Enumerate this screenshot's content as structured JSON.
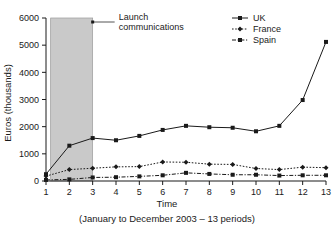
{
  "chart_data": {
    "type": "line",
    "title": "",
    "xlabel": "Time",
    "ylabel": "Euros (thousands)",
    "caption": "(January to December 2003 – 13 periods)",
    "x": [
      1,
      2,
      3,
      4,
      5,
      6,
      7,
      8,
      9,
      10,
      11,
      12,
      13
    ],
    "xtick_labels": [
      "1",
      "2",
      "3",
      "4",
      "5",
      "6",
      "7",
      "8",
      "9",
      "10",
      "11",
      "12",
      "13"
    ],
    "ytick_labels": [
      "0",
      "1000",
      "2000",
      "3000",
      "4000",
      "5000",
      "6000"
    ],
    "yticks": [
      0,
      1000,
      2000,
      3000,
      4000,
      5000,
      6000
    ],
    "xlim": [
      1,
      13
    ],
    "ylim": [
      0,
      6000
    ],
    "grid": false,
    "legend_position": "top-right",
    "series": [
      {
        "name": "UK",
        "values": [
          250,
          1300,
          1580,
          1500,
          1660,
          1880,
          2030,
          1980,
          1960,
          1830,
          2030,
          2980,
          5120
        ],
        "line_style": "solid",
        "marker": "square",
        "color": "#1a1a1a"
      },
      {
        "name": "France",
        "values": [
          180,
          420,
          470,
          520,
          530,
          700,
          690,
          620,
          610,
          460,
          420,
          510,
          490
        ],
        "line_style": "dotted",
        "marker": "diamond",
        "color": "#1a1a1a"
      },
      {
        "name": "Spain",
        "values": [
          40,
          60,
          130,
          140,
          170,
          210,
          300,
          260,
          230,
          230,
          200,
          210,
          210
        ],
        "line_style": "dashdot",
        "marker": "square",
        "color": "#1a1a1a"
      }
    ],
    "annotations": [
      {
        "label_line1": "Launch",
        "label_line2": "communications",
        "band_x_start": 1.2,
        "band_x_end": 3.0,
        "band_color": "#c9c9c9"
      }
    ]
  }
}
